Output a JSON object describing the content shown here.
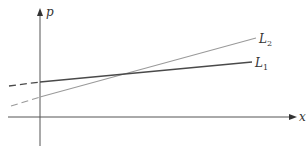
{
  "diagram": {
    "axes": {
      "x_label": "x",
      "y_label": "p"
    },
    "lines": [
      {
        "id": "L1",
        "label_main": "L",
        "label_sub": "1",
        "color": "#4a4a4a",
        "description": "flatter line, dashed extension to the left of the p-axis"
      },
      {
        "id": "L2",
        "label_main": "L",
        "label_sub": "2",
        "color": "#9a9a9a",
        "description": "steeper line, dashed extension to the left of the p-axis"
      }
    ]
  }
}
